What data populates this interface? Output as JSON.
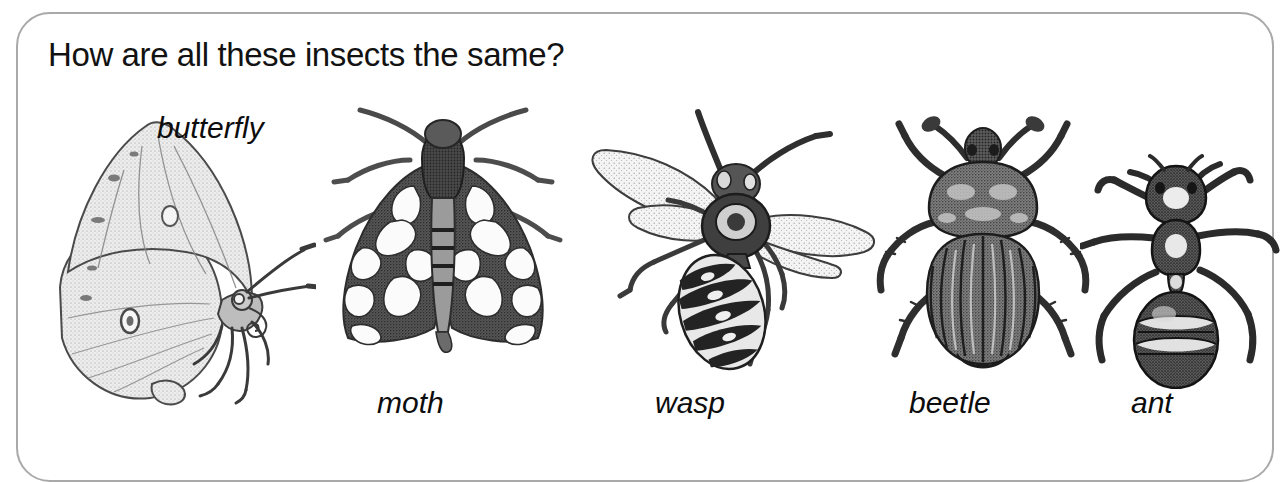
{
  "card": {
    "border_color": "#a9a9a9",
    "background_color": "#ffffff"
  },
  "title": {
    "text": "How are all these insects the same?",
    "color": "#121212"
  },
  "insects": [
    {
      "id": "butterfly",
      "label": "butterfly",
      "label_position": "top-right-of-figure"
    },
    {
      "id": "moth",
      "label": "moth",
      "label_position": "below-figure"
    },
    {
      "id": "wasp",
      "label": "wasp",
      "label_position": "below-figure"
    },
    {
      "id": "beetle",
      "label": "beetle",
      "label_position": "below-figure"
    },
    {
      "id": "ant",
      "label": "ant",
      "label_position": "below-figure"
    }
  ],
  "illustration_style": {
    "medium": "black-and-white stippled engraving",
    "ink": "#2b2b2b",
    "light_fill": "#e9e9e9",
    "mid_fill": "#9a9a9a",
    "dark_fill": "#4a4a4a"
  }
}
